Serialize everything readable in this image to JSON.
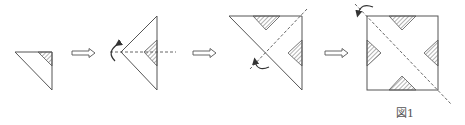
{
  "figure": {
    "caption": "図1",
    "colors": {
      "stroke": "#555555",
      "hatch": "#666666",
      "background": "#ffffff"
    },
    "steps": [
      {
        "id": 1,
        "shape": "right-triangle",
        "hatched_regions": 1
      },
      {
        "id": 2,
        "shape": "triangle-with-fold-line",
        "hatched_regions": 1,
        "fold_arrow": "counter-clockwise-left"
      },
      {
        "id": 3,
        "shape": "large-right-triangle",
        "hatched_regions": 2,
        "fold_arrow": "counter-clockwise-bottom"
      },
      {
        "id": 4,
        "shape": "square",
        "hatched_regions": 4,
        "fold_arrow": "counter-clockwise-top-left"
      }
    ],
    "arrows": [
      "⇒",
      "⇒",
      "⇒"
    ]
  }
}
